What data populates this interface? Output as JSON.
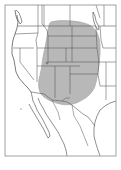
{
  "map": {
    "title": "",
    "region": "Western North America",
    "frame_color": "#8a8a8a",
    "border_color": "#555555",
    "coast_color": "#444444",
    "range_fill": "#b8b8b8",
    "range_stroke": "#9a9a9a",
    "background": "#ffffff",
    "labels": []
  }
}
